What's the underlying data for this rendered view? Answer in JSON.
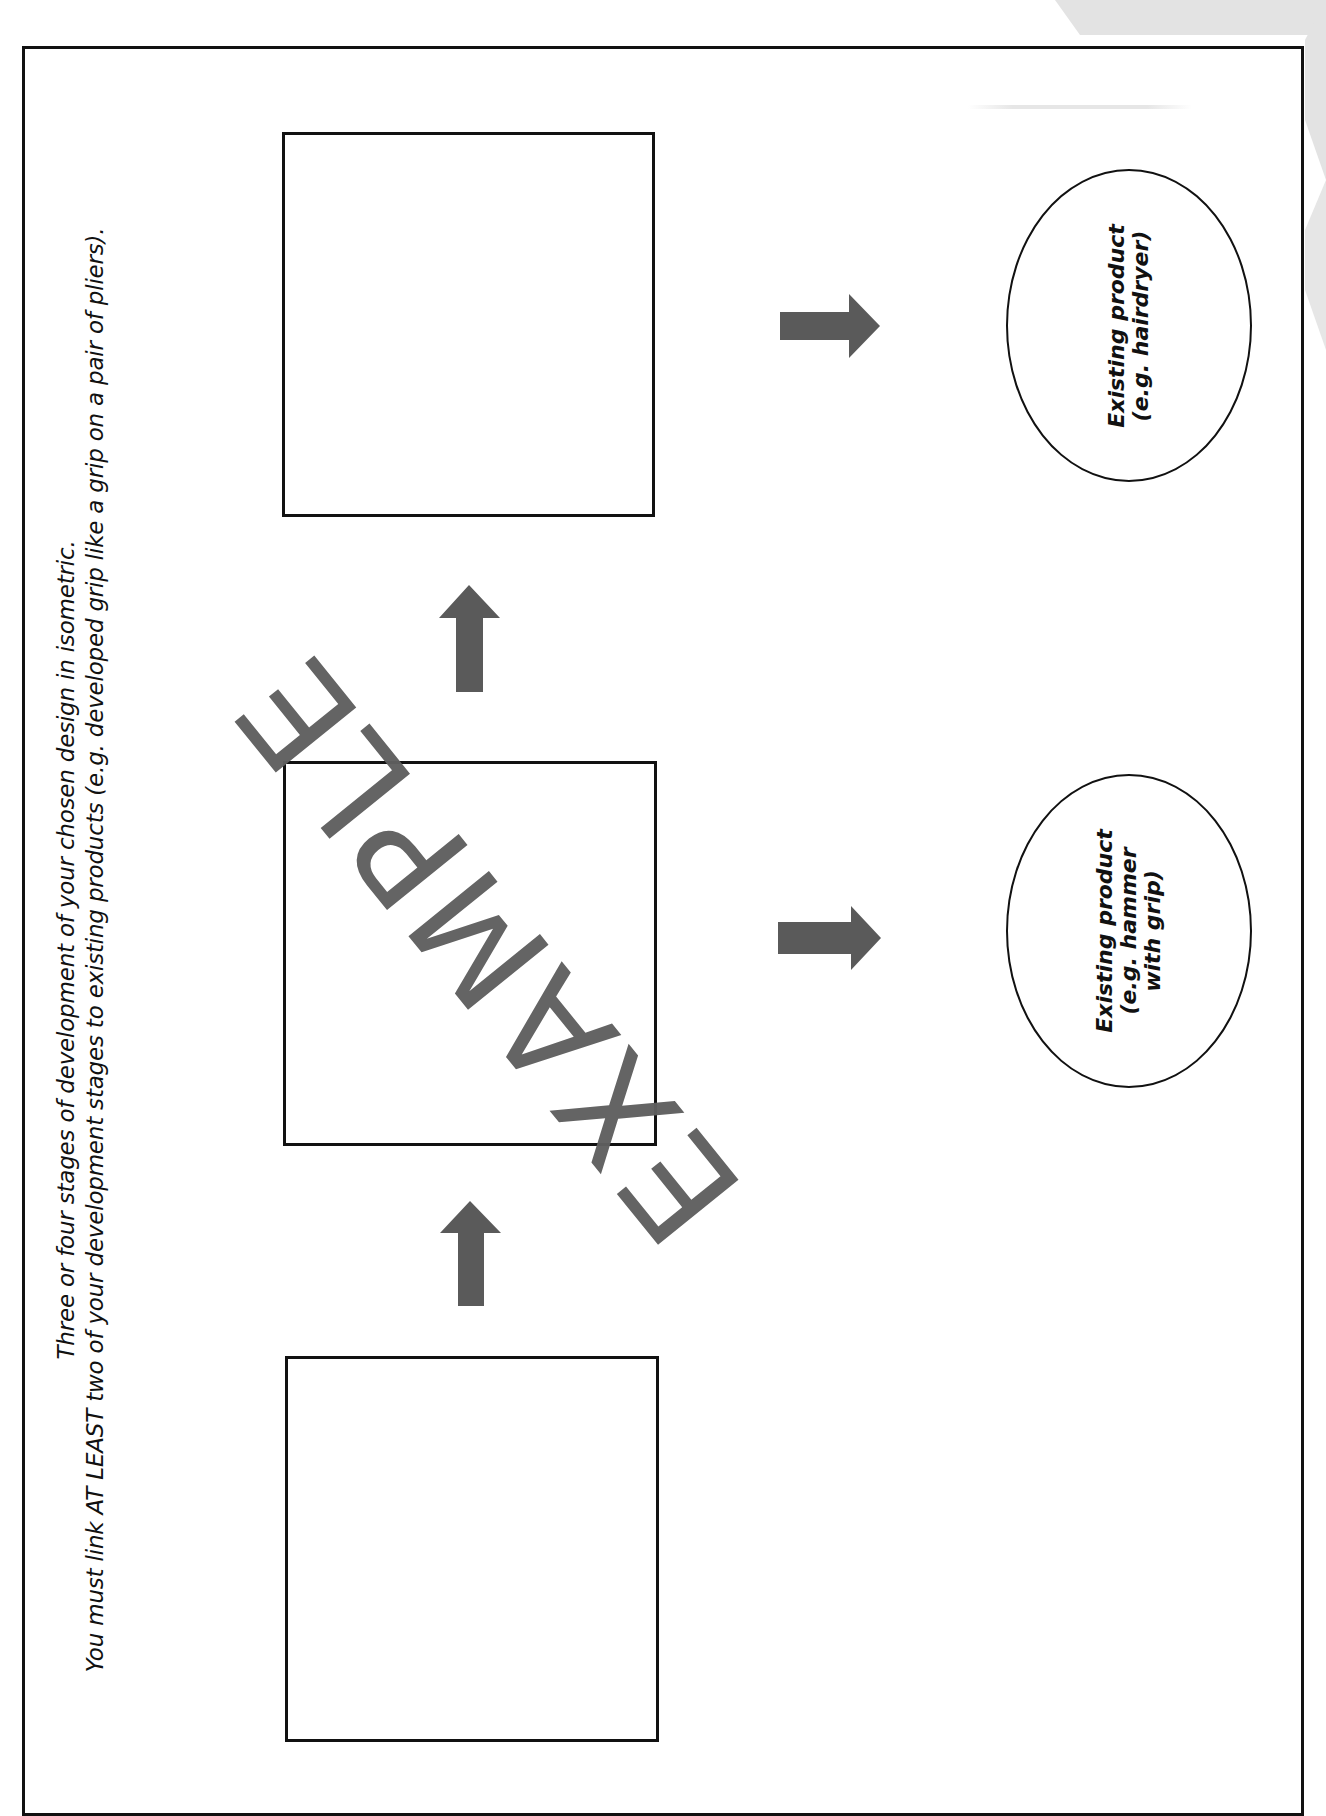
{
  "instructions": {
    "line1": "Three or four stages of development of your chosen design in isometric.",
    "line2": "You must link AT LEAST two of your development stages to existing products (e.g. developed grip like a grip on a pair of pliers)."
  },
  "watermark": "EXAMPLE",
  "stages": [
    {
      "label": "stage-1-box",
      "position": "bottom"
    },
    {
      "label": "stage-2-box",
      "position": "middle"
    },
    {
      "label": "stage-3-box",
      "position": "top"
    }
  ],
  "existing_products": [
    {
      "line1": "Existing product",
      "line2": "(e.g. hairdryer)",
      "line3": ""
    },
    {
      "line1": "Existing product",
      "line2": "(e.g. hammer",
      "line3": "with grip)"
    }
  ],
  "colors": {
    "arrow": "#5a5a5a",
    "border": "#111111",
    "decoration": "#e2e2e2",
    "watermark": "#5f5f5f"
  }
}
